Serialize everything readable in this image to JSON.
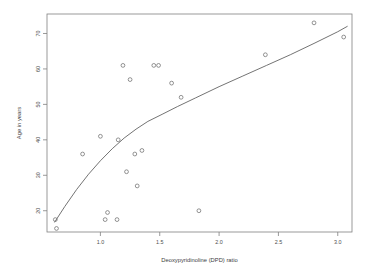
{
  "chart_data": {
    "type": "scatter",
    "title": "",
    "xlabel": "Deoxypyridinoline (DPD) ratio",
    "ylabel": "Age in years",
    "xlim": [
      0.55,
      3.12
    ],
    "ylim": [
      14.0,
      75.5
    ],
    "xticks": [
      1.0,
      1.5,
      2.0,
      2.5,
      3.0
    ],
    "xticklabels": [
      "1.0",
      "1.5",
      "2.0",
      "2.5",
      "3.0"
    ],
    "yticks": [
      20,
      30,
      40,
      50,
      60,
      70
    ],
    "yticklabels": [
      "20",
      "30",
      "40",
      "50",
      "60",
      "70"
    ],
    "grid": false,
    "legend": null,
    "marker": "open-circle",
    "points": [
      {
        "x": 0.62,
        "y": 17.5
      },
      {
        "x": 0.63,
        "y": 15.0
      },
      {
        "x": 0.85,
        "y": 36.0
      },
      {
        "x": 1.0,
        "y": 41.0
      },
      {
        "x": 1.04,
        "y": 17.5
      },
      {
        "x": 1.06,
        "y": 19.5
      },
      {
        "x": 1.14,
        "y": 17.5
      },
      {
        "x": 1.15,
        "y": 40.0
      },
      {
        "x": 1.19,
        "y": 61.0
      },
      {
        "x": 1.22,
        "y": 31.0
      },
      {
        "x": 1.25,
        "y": 57.0
      },
      {
        "x": 1.29,
        "y": 36.0
      },
      {
        "x": 1.31,
        "y": 27.0
      },
      {
        "x": 1.35,
        "y": 37.0
      },
      {
        "x": 1.45,
        "y": 61.0
      },
      {
        "x": 1.49,
        "y": 61.0
      },
      {
        "x": 1.6,
        "y": 56.0
      },
      {
        "x": 1.68,
        "y": 52.0
      },
      {
        "x": 1.83,
        "y": 20.0
      },
      {
        "x": 2.39,
        "y": 64.0
      },
      {
        "x": 2.8,
        "y": 73.0
      },
      {
        "x": 3.05,
        "y": 69.0
      }
    ],
    "series": [
      {
        "name": "fitted-curve",
        "type": "line",
        "points": [
          {
            "x": 0.615,
            "y": 16.8
          },
          {
            "x": 0.7,
            "y": 21.2
          },
          {
            "x": 0.8,
            "y": 26.0
          },
          {
            "x": 0.9,
            "y": 30.3
          },
          {
            "x": 1.0,
            "y": 34.1
          },
          {
            "x": 1.1,
            "y": 37.5
          },
          {
            "x": 1.2,
            "y": 40.5
          },
          {
            "x": 1.3,
            "y": 43.0
          },
          {
            "x": 1.4,
            "y": 45.2
          },
          {
            "x": 1.52,
            "y": 47.2
          },
          {
            "x": 1.65,
            "y": 49.4
          },
          {
            "x": 1.8,
            "y": 51.8
          },
          {
            "x": 2.0,
            "y": 55.0
          },
          {
            "x": 2.2,
            "y": 58.0
          },
          {
            "x": 2.4,
            "y": 61.0
          },
          {
            "x": 2.6,
            "y": 64.0
          },
          {
            "x": 2.8,
            "y": 67.2
          },
          {
            "x": 3.0,
            "y": 70.5
          },
          {
            "x": 3.08,
            "y": 72.0
          }
        ]
      }
    ]
  }
}
